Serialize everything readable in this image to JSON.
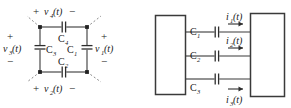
{
  "figure": {
    "background_color": "#ffffff",
    "ink_color": "#2e2e2e",
    "dash_color": "#8c8c8c",
    "panels": [
      {
        "id": "left",
        "name": "capacitor-loop-circuit"
      },
      {
        "id": "right",
        "name": "two-port-capacitor-network"
      }
    ]
  },
  "left_panel": {
    "name": "capacitor-loop-circuit",
    "top_branch": {
      "component_label": "C",
      "component_sub": "4",
      "voltage_plus": "+",
      "voltage_name": "v",
      "voltage_sub": "4",
      "voltage_arg": "(t)",
      "voltage_minus": "−"
    },
    "bottom_branch": {
      "component_label": "C",
      "component_sub": "2",
      "voltage_plus": "+",
      "voltage_name": "v",
      "voltage_sub": "2",
      "voltage_arg": "(t)",
      "voltage_minus": "−"
    },
    "left_branch": {
      "component_label": "C",
      "component_sub": "3",
      "voltage_plus": "+",
      "voltage_name": "v",
      "voltage_sub": "3",
      "voltage_arg": "(t)",
      "voltage_minus": "−"
    },
    "right_branch": {
      "component_label": "C",
      "component_sub": "1",
      "voltage_plus": "+",
      "voltage_name": "v",
      "voltage_sub": "1",
      "voltage_arg": "(t)",
      "voltage_minus": "−"
    }
  },
  "right_panel": {
    "name": "two-port-capacitor-network",
    "left_block_label": "",
    "right_block_label": "",
    "branches": [
      {
        "component_label": "C",
        "component_sub": "1",
        "current_name": "i",
        "current_sub": "1",
        "current_arg": "(t)",
        "direction": "right"
      },
      {
        "component_label": "C",
        "component_sub": "2",
        "current_name": "i",
        "current_sub": "2",
        "current_arg": "(t)",
        "direction": "right"
      },
      {
        "component_label": "C",
        "component_sub": "3",
        "current_name": "i",
        "current_sub": "3",
        "current_arg": "(t)",
        "direction": "right"
      }
    ]
  }
}
